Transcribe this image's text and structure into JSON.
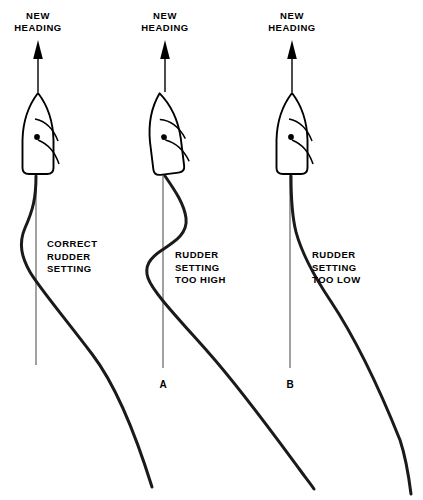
{
  "figure": {
    "background_color": "#ffffff",
    "ink_color": "#000000",
    "width": 423,
    "height": 500
  },
  "headings": [
    {
      "text": "NEW\nHEADING"
    },
    {
      "text": "NEW\nHEADING"
    },
    {
      "text": "NEW\nHEADING"
    }
  ],
  "cases": [
    {
      "id": "",
      "label": "CORRECT\nRUDDER\nSETTING",
      "description": "Track settles smoothly onto the new heading with a single small deviation."
    },
    {
      "id": "A",
      "label": "RUDDER\nSETTING\nTOO HIGH",
      "description": "Track overshoots and oscillates across the new heading line before settling."
    },
    {
      "id": "B",
      "label": "RUDDER\nSETTING\nTOO LOW",
      "description": "Track undershoots, curving away without regaining the new heading line."
    }
  ],
  "ship_icon": {
    "name": "ship-hull-plan-view",
    "features": [
      "pointed-bow",
      "flat-stern",
      "pivot-point-dot",
      "bow-wave-arcs"
    ]
  },
  "arrow_icon": {
    "name": "heading-arrow-up"
  }
}
